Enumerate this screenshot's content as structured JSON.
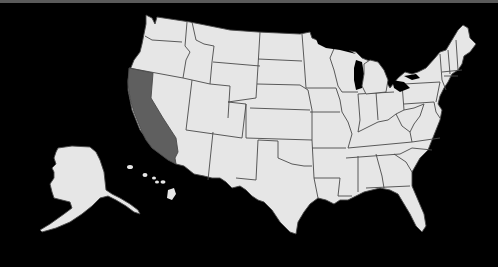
{
  "map": {
    "title": "United States map",
    "highlighted_state": "California",
    "colors": {
      "background": "#000000",
      "top_strip": "#5a5a5a",
      "state_fill": "#e6e6e6",
      "highlight_fill": "#5f5f5f",
      "border": "#4a4a4a"
    },
    "states": [
      {
        "name": "Washington",
        "highlighted": false
      },
      {
        "name": "Oregon",
        "highlighted": false
      },
      {
        "name": "California",
        "highlighted": true
      },
      {
        "name": "Nevada",
        "highlighted": false
      },
      {
        "name": "Idaho",
        "highlighted": false
      },
      {
        "name": "Montana",
        "highlighted": false
      },
      {
        "name": "Wyoming",
        "highlighted": false
      },
      {
        "name": "Utah",
        "highlighted": false
      },
      {
        "name": "Arizona",
        "highlighted": false
      },
      {
        "name": "Colorado",
        "highlighted": false
      },
      {
        "name": "New Mexico",
        "highlighted": false
      },
      {
        "name": "North Dakota",
        "highlighted": false
      },
      {
        "name": "South Dakota",
        "highlighted": false
      },
      {
        "name": "Nebraska",
        "highlighted": false
      },
      {
        "name": "Kansas",
        "highlighted": false
      },
      {
        "name": "Oklahoma",
        "highlighted": false
      },
      {
        "name": "Texas",
        "highlighted": false
      },
      {
        "name": "Minnesota",
        "highlighted": false
      },
      {
        "name": "Iowa",
        "highlighted": false
      },
      {
        "name": "Missouri",
        "highlighted": false
      },
      {
        "name": "Arkansas",
        "highlighted": false
      },
      {
        "name": "Louisiana",
        "highlighted": false
      },
      {
        "name": "Wisconsin",
        "highlighted": false
      },
      {
        "name": "Illinois",
        "highlighted": false
      },
      {
        "name": "Michigan",
        "highlighted": false
      },
      {
        "name": "Indiana",
        "highlighted": false
      },
      {
        "name": "Ohio",
        "highlighted": false
      },
      {
        "name": "Kentucky",
        "highlighted": false
      },
      {
        "name": "Tennessee",
        "highlighted": false
      },
      {
        "name": "Mississippi",
        "highlighted": false
      },
      {
        "name": "Alabama",
        "highlighted": false
      },
      {
        "name": "Georgia",
        "highlighted": false
      },
      {
        "name": "Florida",
        "highlighted": false
      },
      {
        "name": "South Carolina",
        "highlighted": false
      },
      {
        "name": "North Carolina",
        "highlighted": false
      },
      {
        "name": "Virginia",
        "highlighted": false
      },
      {
        "name": "West Virginia",
        "highlighted": false
      },
      {
        "name": "Pennsylvania",
        "highlighted": false
      },
      {
        "name": "New York",
        "highlighted": false
      },
      {
        "name": "New England",
        "highlighted": false
      },
      {
        "name": "Alaska",
        "highlighted": false
      },
      {
        "name": "Hawaii",
        "highlighted": false
      }
    ]
  }
}
